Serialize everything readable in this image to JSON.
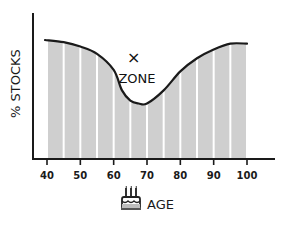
{
  "chart_data": {
    "type": "area",
    "title": "",
    "xlabel": "AGE",
    "ylabel": "% STOCKS",
    "xlim": [
      40,
      100
    ],
    "ylim": [
      0,
      100
    ],
    "x_ticks": [
      40,
      50,
      60,
      70,
      80,
      90,
      100
    ],
    "x_tick_labels": [
      "40",
      "50",
      "60",
      "70",
      "80",
      "90",
      "100"
    ],
    "y_ticks": [],
    "grid": false,
    "bar_bin_years": 5,
    "bar_fill": "#cfcfcf",
    "line_color": "#1a1a1a",
    "series": [
      {
        "name": "% stocks by age",
        "x": [
          40,
          45,
          50,
          55,
          60,
          62.5,
          65,
          67.5,
          70,
          75,
          80,
          85,
          90,
          95,
          100
        ],
        "y": [
          81.5,
          80,
          77,
          72,
          61,
          47,
          40,
          38,
          38,
          47,
          60,
          69,
          75,
          79,
          79
        ]
      }
    ],
    "annotations": [
      {
        "text": "×",
        "x": 66,
        "y": 66
      },
      {
        "text": "ZONE",
        "x": 67,
        "y": 52
      }
    ],
    "xlabel_icon": "birthday-cake-icon"
  }
}
